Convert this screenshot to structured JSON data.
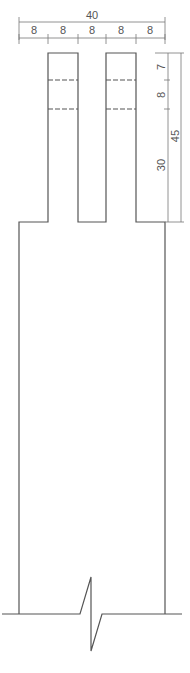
{
  "drawing": {
    "title": "Finger joint detail",
    "colors": {
      "line": "#555555",
      "dimension": "#777777",
      "background": "#ffffff"
    },
    "top_dimensions": {
      "overall": "40",
      "segments": [
        "8",
        "8",
        "8",
        "8",
        "8"
      ]
    },
    "right_dimensions": {
      "segments": [
        "7",
        "8",
        "30"
      ],
      "overall": "45"
    },
    "features": {
      "fingers": 2,
      "dashed_lines": 2,
      "break_symbol": "zigzag-break-line"
    }
  }
}
